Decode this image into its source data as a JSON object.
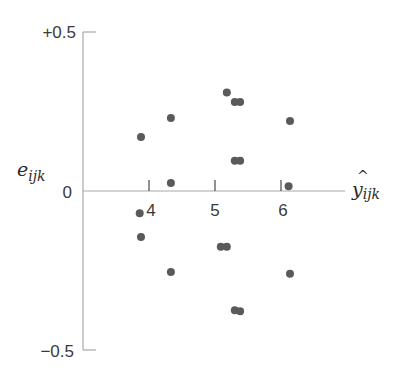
{
  "chart_data": {
    "type": "scatter",
    "title": "",
    "xlabel": "ŷ_ijk",
    "ylabel": "e_ijk",
    "x_ticks": [
      4,
      5,
      6
    ],
    "x_tick_labels": [
      "4",
      "5",
      "6"
    ],
    "y_ticks": [
      0.5,
      0,
      -0.5
    ],
    "y_tick_labels": [
      "+0.5",
      "0",
      "−0.5"
    ],
    "xlim": [
      3.0,
      7.0
    ],
    "ylim": [
      -0.5,
      0.5
    ],
    "grid": false,
    "legend": null,
    "point_color": "#5a5a5a",
    "axis_color": "#9a9a9a",
    "series": [
      {
        "name": "residuals",
        "points": [
          {
            "x": 3.88,
            "y": 0.17
          },
          {
            "x": 4.33,
            "y": 0.23
          },
          {
            "x": 4.33,
            "y": 0.025
          },
          {
            "x": 5.17,
            "y": 0.31
          },
          {
            "x": 5.29,
            "y": 0.28
          },
          {
            "x": 5.37,
            "y": 0.28
          },
          {
            "x": 5.29,
            "y": 0.095
          },
          {
            "x": 5.37,
            "y": 0.095
          },
          {
            "x": 6.12,
            "y": 0.22
          },
          {
            "x": 6.1,
            "y": 0.015
          },
          {
            "x": 3.86,
            "y": -0.07
          },
          {
            "x": 3.88,
            "y": -0.145
          },
          {
            "x": 5.08,
            "y": -0.175
          },
          {
            "x": 5.17,
            "y": -0.175
          },
          {
            "x": 4.33,
            "y": -0.255
          },
          {
            "x": 6.12,
            "y": -0.26
          },
          {
            "x": 5.29,
            "y": -0.375
          },
          {
            "x": 5.37,
            "y": -0.378
          }
        ]
      }
    ]
  },
  "labels": {
    "y_top": "+0.5",
    "y_zero": "0",
    "y_bottom": "−0.5",
    "y_axis_symbol": "e",
    "y_axis_subscript": "ijk",
    "x_axis_symbol": "y",
    "x_axis_hat": "^",
    "x_axis_subscript": "ijk",
    "x_tick_4": "4",
    "x_tick_5": "5",
    "x_tick_6": "6"
  }
}
